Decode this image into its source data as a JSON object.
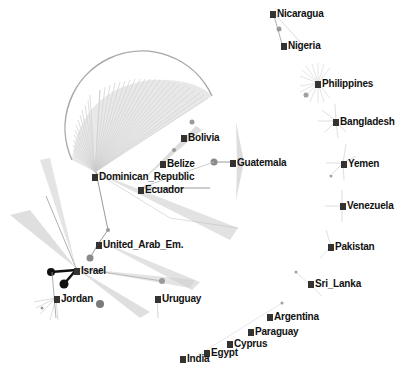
{
  "graph": {
    "type": "network",
    "colors": {
      "edge": "#9a9a9a",
      "fan": "#b5b5b5",
      "node_square": "#333333",
      "label": "#111111",
      "dot": "#8a8a8a",
      "highlight": "#111111"
    },
    "nodes": [
      {
        "id": "nicaragua",
        "label": "Nicaragua",
        "x": 270,
        "y": 8
      },
      {
        "id": "nigeria",
        "label": "Nigeria",
        "x": 281,
        "y": 40
      },
      {
        "id": "philippines",
        "label": "Philippines",
        "x": 315,
        "y": 78
      },
      {
        "id": "bangladesh",
        "label": "Bangladesh",
        "x": 333,
        "y": 116
      },
      {
        "id": "bolivia",
        "label": "Bolivia",
        "x": 181,
        "y": 132
      },
      {
        "id": "belize",
        "label": "Belize",
        "x": 160,
        "y": 158
      },
      {
        "id": "guatemala",
        "label": "Guatemala",
        "x": 230,
        "y": 157
      },
      {
        "id": "yemen",
        "label": "Yemen",
        "x": 341,
        "y": 158
      },
      {
        "id": "dominican_republic",
        "label": "Dominican_Republic",
        "x": 92,
        "y": 171
      },
      {
        "id": "ecuador",
        "label": "Ecuador",
        "x": 138,
        "y": 184
      },
      {
        "id": "venezuela",
        "label": "Venezuela",
        "x": 340,
        "y": 200
      },
      {
        "id": "united_arab_em",
        "label": "United_Arab_Em.",
        "x": 96,
        "y": 239
      },
      {
        "id": "pakistan",
        "label": "Pakistan",
        "x": 328,
        "y": 241
      },
      {
        "id": "israel",
        "label": "Israel",
        "x": 74,
        "y": 265
      },
      {
        "id": "sri_lanka",
        "label": "Sri_Lanka",
        "x": 308,
        "y": 278
      },
      {
        "id": "jordan",
        "label": "Jordan",
        "x": 54,
        "y": 293
      },
      {
        "id": "uruguay",
        "label": "Uruguay",
        "x": 155,
        "y": 293
      },
      {
        "id": "argentina",
        "label": "Argentina",
        "x": 267,
        "y": 311
      },
      {
        "id": "paraguay",
        "label": "Paraguay",
        "x": 248,
        "y": 326
      },
      {
        "id": "cyprus",
        "label": "Cyprus",
        "x": 227,
        "y": 338
      },
      {
        "id": "egypt",
        "label": "Egypt",
        "x": 204,
        "y": 347
      },
      {
        "id": "india",
        "label": "India",
        "x": 180,
        "y": 353
      }
    ]
  }
}
